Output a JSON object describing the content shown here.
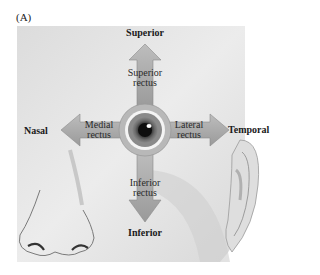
{
  "figure": {
    "panel_label": "(A)"
  },
  "directions": {
    "superior": "Superior",
    "inferior": "Inferior",
    "nasal": "Nasal",
    "temporal": "Temporal"
  },
  "muscles": {
    "superior_rectus": [
      "Superior",
      "rectus"
    ],
    "inferior_rectus": [
      "Inferior",
      "rectus"
    ],
    "medial_rectus": [
      "Medial",
      "rectus"
    ],
    "lateral_rectus": [
      "Lateral",
      "rectus"
    ]
  },
  "colors": {
    "background": "#ffffff",
    "face_panel": "#e4e4e4",
    "muscle_fill": "#a9a9a9",
    "iris": "#5a5a5a",
    "pupil": "#111111"
  }
}
